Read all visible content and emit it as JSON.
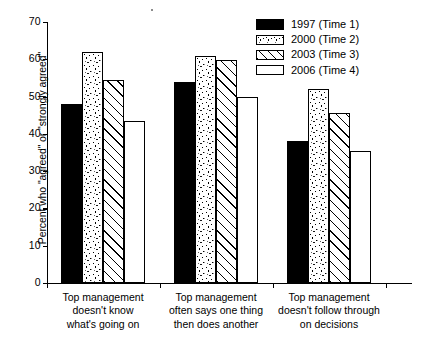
{
  "chart_data": {
    "type": "bar",
    "title": "",
    "xlabel": "",
    "ylabel": "Percent who \"agreed\" or \"strongly agreed\"",
    "ylim": [
      0,
      70
    ],
    "yticks": [
      0,
      10,
      20,
      30,
      40,
      50,
      60,
      70
    ],
    "ytick_labels": [
      "0",
      "10",
      "20",
      "30",
      "40",
      "50",
      "60",
      "70"
    ],
    "grid": false,
    "legend_position": "top-right",
    "categories": [
      "Top management\ndoesn't know\nwhat's going on",
      "Top management\noften says one thing\nthen does another",
      "Top management\ndoesn't follow through\non decisions"
    ],
    "series": [
      {
        "name": "1997 (Time 1)",
        "pattern": "solid-black",
        "values": [
          48,
          54,
          38
        ]
      },
      {
        "name": "2000 (Time 2)",
        "pattern": "stippled",
        "values": [
          62,
          61,
          52
        ]
      },
      {
        "name": "2003 (Time 3)",
        "pattern": "diagonal-hatch",
        "values": [
          54.5,
          59.8,
          45.5
        ]
      },
      {
        "name": "2006 (Time 4)",
        "pattern": "white-empty",
        "values": [
          43.5,
          50,
          35.5
        ]
      }
    ]
  },
  "legend": {
    "items": [
      {
        "label": "1997 (Time 1)",
        "pattern": "solid"
      },
      {
        "label": "2000 (Time 2)",
        "pattern": "stipple"
      },
      {
        "label": "2003 (Time 3)",
        "pattern": "hatch"
      },
      {
        "label": "2006 (Time 4)",
        "pattern": "empty"
      }
    ]
  },
  "colors": {
    "axis": "#000000",
    "bar_outline": "#000000",
    "series_1997": "#000000",
    "series_2000": "#ffffff",
    "series_2003": "#ffffff",
    "series_2006": "#ffffff",
    "background": "#ffffff"
  }
}
